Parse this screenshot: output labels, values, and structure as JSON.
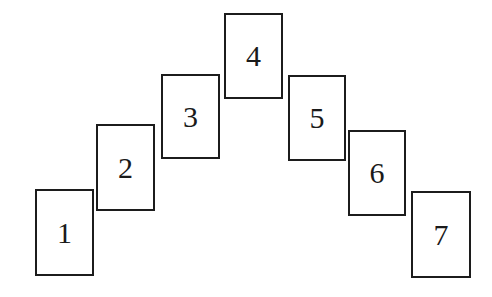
{
  "figure": {
    "kind": "arch-of-numbered-rectangles",
    "background_color": "#ffffff",
    "box_fill_color": "#ffffff",
    "box_border_color": "#1c1c1c",
    "label_color": "#1a1a1a",
    "canvas": {
      "width": 492,
      "height": 297
    },
    "boxes": [
      {
        "label": "1",
        "x": 35,
        "y": 189,
        "width": 59,
        "height": 87,
        "font_size": 30
      },
      {
        "label": "2",
        "x": 96,
        "y": 124,
        "width": 59,
        "height": 87,
        "font_size": 30
      },
      {
        "label": "3",
        "x": 161,
        "y": 74,
        "width": 59,
        "height": 85,
        "font_size": 30
      },
      {
        "label": "4",
        "x": 224,
        "y": 13,
        "width": 59,
        "height": 86,
        "font_size": 30
      },
      {
        "label": "5",
        "x": 288,
        "y": 75,
        "width": 58,
        "height": 86,
        "font_size": 30
      },
      {
        "label": "6",
        "x": 348,
        "y": 130,
        "width": 58,
        "height": 86,
        "font_size": 30
      },
      {
        "label": "7",
        "x": 411,
        "y": 191,
        "width": 60,
        "height": 87,
        "font_size": 30
      }
    ]
  }
}
